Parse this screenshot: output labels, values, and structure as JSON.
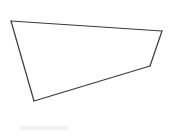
{
  "canvas": {
    "width": 169,
    "height": 136,
    "background_color": "#ffffff"
  },
  "figure": {
    "name": "crossed-quadrilateral",
    "stroke_color": "#3a3a3a",
    "stroke_width": 1.2,
    "fill": "none",
    "vertices": [
      {
        "id": "A",
        "label": "top-left-vertex",
        "x": 11,
        "y": 21
      },
      {
        "id": "B",
        "label": "bottom-left-vertex",
        "x": 34,
        "y": 101
      },
      {
        "id": "C",
        "label": "lower-right-vertex",
        "x": 150,
        "y": 66
      },
      {
        "id": "D",
        "label": "top-right-vertex",
        "x": 162,
        "y": 31
      }
    ],
    "edges": [
      {
        "id": "AD",
        "label": "upper-long-diagonal",
        "from": "A",
        "to": "D",
        "path": "M 11 21 L 162 31"
      },
      {
        "id": "DC",
        "label": "right-short-edge",
        "from": "D",
        "to": "C",
        "path": "M 162 31 L 150 66"
      },
      {
        "id": "CB",
        "label": "lower-long-diagonal",
        "from": "C",
        "to": "B",
        "path": "M 150 66 L 34 101"
      },
      {
        "id": "BA",
        "label": "left-edge",
        "from": "B",
        "to": "A",
        "path": "M 34 101 L 11 21"
      }
    ],
    "intersection": {
      "label": "crossing-point",
      "x": 117,
      "y": 57
    },
    "closed_outline_path": "M 11 21 L 162 31 L 150 66 L 34 101 Z"
  },
  "artifacts": {
    "bottom_smudge": {
      "label": "faint-scan-smudge",
      "x": 20,
      "y": 126,
      "width": 48,
      "height": 4,
      "color": "#f2f2f2"
    }
  }
}
